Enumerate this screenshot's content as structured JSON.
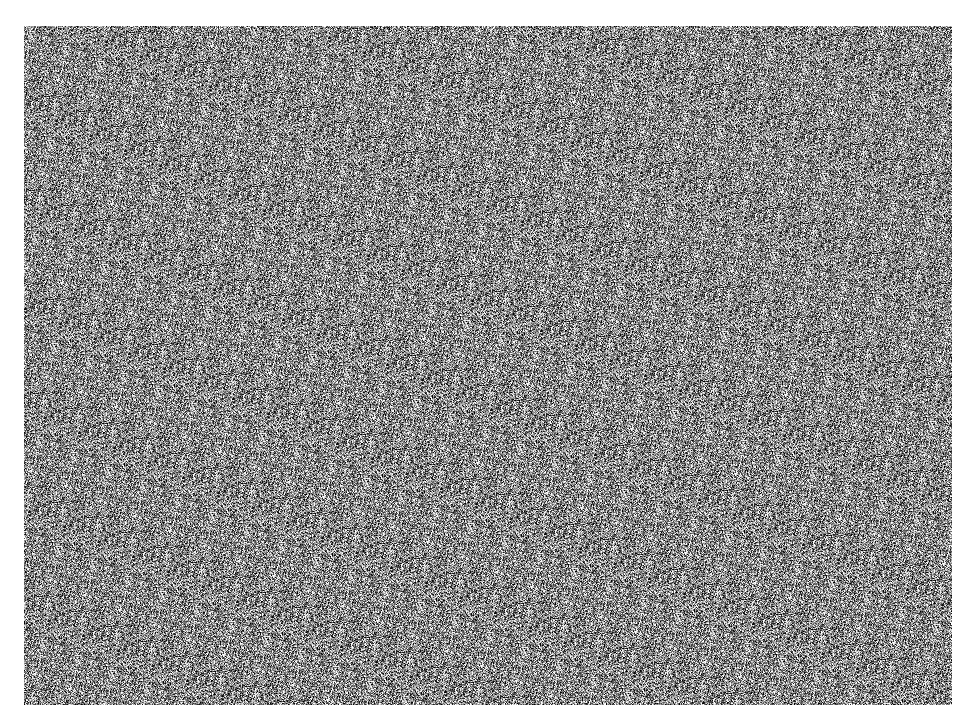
{
  "figure": {
    "colors": {
      "background": "#ffffff",
      "noise_mid": "#8a8a8a",
      "holes": "#ffffff"
    },
    "holes": [
      {
        "x": 416,
        "y": 12
      },
      {
        "x": 574,
        "y": 12
      }
    ]
  },
  "caption": {
    "text": "",
    "note_visible": "caption text clipped at bottom edge; only glyph tops visible"
  }
}
